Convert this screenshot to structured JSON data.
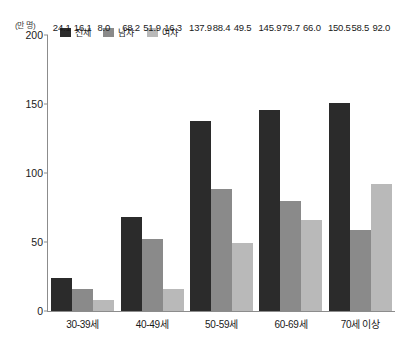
{
  "chart_data": {
    "type": "bar",
    "title": "",
    "subtitle": "",
    "xlabel": "",
    "ylabel": "",
    "unit_label": "(만 명)",
    "ylim": [
      0,
      200
    ],
    "yticks": [
      0,
      50,
      100,
      150,
      200
    ],
    "ytick_labels": [
      "0",
      "50",
      "100",
      "150",
      "200"
    ],
    "grid": false,
    "legend_position": "top-left",
    "categories": [
      "30-39세",
      "40-49세",
      "50-59세",
      "60-69세",
      "70세 이상"
    ],
    "series": [
      {
        "name": "전체",
        "color": "#2b2b2b",
        "values": [
          24.1,
          68.2,
          137.9,
          145.9,
          150.5
        ],
        "labels": [
          "24.1",
          "68.2",
          "137.9",
          "145.9",
          "150.5"
        ]
      },
      {
        "name": "남자",
        "color": "#8a8a8a",
        "values": [
          16.1,
          51.9,
          88.4,
          79.7,
          58.5
        ],
        "labels": [
          "16.1",
          "51.9",
          "88.4",
          "79.7",
          "58.5"
        ]
      },
      {
        "name": "여자",
        "color": "#b9b9b9",
        "values": [
          8.0,
          16.3,
          49.5,
          66.0,
          92.0
        ],
        "labels": [
          "8.0",
          "16.3",
          "49.5",
          "66.0",
          "92.0"
        ]
      }
    ]
  },
  "colors": {
    "axis": "#8c8c8c",
    "text": "#1a1a1a",
    "background": "#ffffff"
  }
}
